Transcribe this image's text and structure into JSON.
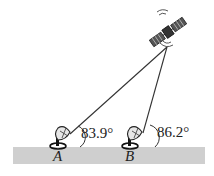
{
  "diagram": {
    "type": "geometry-word-problem",
    "colors": {
      "ground": "#cfcfcf",
      "line": "#333333",
      "background": "#ffffff"
    },
    "satellite": {
      "label": "satellite",
      "x": 167,
      "y": 47
    },
    "stations": [
      {
        "id": "A",
        "label": "A",
        "x": 68,
        "y": 138,
        "angle_label": "83.9°"
      },
      {
        "id": "B",
        "label": "B",
        "x": 142,
        "y": 138,
        "angle_label": "86.2°"
      }
    ],
    "ground": {
      "x": 13,
      "y": 147,
      "width": 192,
      "height": 17
    }
  }
}
